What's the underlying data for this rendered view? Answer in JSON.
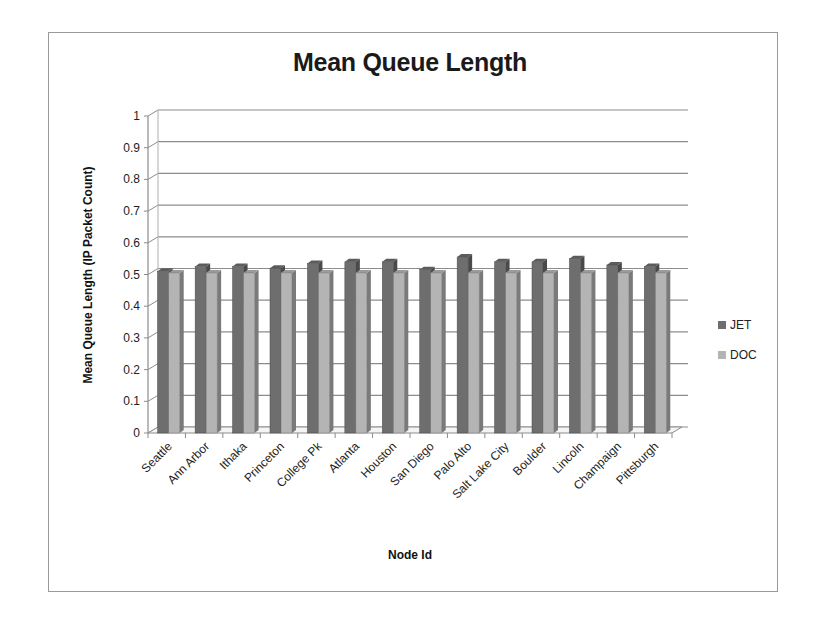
{
  "chart_data": {
    "type": "bar",
    "title": "Mean Queue Length",
    "xlabel": "Node Id",
    "ylabel": "Mean Queue Length (IP Packet  Count)",
    "ylim": [
      0,
      1
    ],
    "yticks": [
      "0",
      "0.1",
      "0.2",
      "0.3",
      "0.4",
      "0.5",
      "0.6",
      "0.7",
      "0.8",
      "0.9",
      "1"
    ],
    "grid": true,
    "legend_position": "right",
    "style": "3d-clustered-column",
    "categories": [
      "Seattle",
      "Ann Arbor",
      "Ithaka",
      "Princeton",
      "College Pk",
      "Atlanta",
      "Houston",
      "San Diego",
      "Palo Alto",
      "Salt Lake City",
      "Boulder",
      "Lincoln",
      "Champaign",
      "Pittsburgh"
    ],
    "series": [
      {
        "name": "JET",
        "color": "#6e6e6e",
        "values": [
          0.51,
          0.525,
          0.525,
          0.52,
          0.535,
          0.54,
          0.54,
          0.515,
          0.555,
          0.54,
          0.54,
          0.55,
          0.53,
          0.525
        ]
      },
      {
        "name": "DOC",
        "color": "#b4b4b4",
        "values": [
          0.505,
          0.505,
          0.505,
          0.505,
          0.505,
          0.505,
          0.505,
          0.505,
          0.505,
          0.505,
          0.505,
          0.505,
          0.505,
          0.505
        ]
      }
    ]
  }
}
